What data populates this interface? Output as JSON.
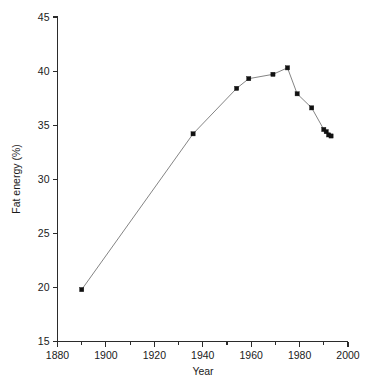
{
  "chart_data": {
    "type": "line",
    "title": "",
    "subtitle": "",
    "xlabel": "Year",
    "ylabel": "Fat energy (%)",
    "xlim": [
      1880,
      2000
    ],
    "ylim": [
      15,
      45
    ],
    "x_ticks": [
      1880,
      1900,
      1920,
      1940,
      1960,
      1980,
      2000
    ],
    "x_tick_labels": [
      "1880",
      "1900",
      "1920",
      "1940",
      "1960",
      "1980",
      "2000"
    ],
    "x_minor_ticks": [
      1890,
      1910,
      1930,
      1950,
      1970,
      1990
    ],
    "y_ticks": [
      15,
      20,
      25,
      30,
      35,
      40,
      45
    ],
    "y_tick_labels": [
      "15",
      "20",
      "25",
      "30",
      "35",
      "40",
      "45"
    ],
    "grid": false,
    "legend": false,
    "legend_position": "none",
    "marker": "square",
    "marker_color": "#111111",
    "line_color": "#6e6e6e",
    "series": [
      {
        "name": "Fat energy",
        "x": [
          1890,
          1936,
          1954,
          1959,
          1969,
          1975,
          1979,
          1985,
          1990,
          1991,
          1992,
          1993
        ],
        "values": [
          19.8,
          34.2,
          38.4,
          39.3,
          39.7,
          40.3,
          37.9,
          36.6,
          34.6,
          34.4,
          34.1,
          34.0
        ]
      }
    ],
    "points": [
      {
        "year": 1890,
        "fat_energy": 19.8
      },
      {
        "year": 1936,
        "fat_energy": 34.2
      },
      {
        "year": 1954,
        "fat_energy": 38.4
      },
      {
        "year": 1959,
        "fat_energy": 39.3
      },
      {
        "year": 1969,
        "fat_energy": 39.7
      },
      {
        "year": 1975,
        "fat_energy": 40.3
      },
      {
        "year": 1979,
        "fat_energy": 37.9
      },
      {
        "year": 1985,
        "fat_energy": 36.6
      },
      {
        "year": 1990,
        "fat_energy": 34.6
      },
      {
        "year": 1991,
        "fat_energy": 34.4
      },
      {
        "year": 1992,
        "fat_energy": 34.1
      },
      {
        "year": 1993,
        "fat_energy": 34.0
      }
    ]
  },
  "colors": {
    "background": "#ffffff",
    "axis": "#2b2b2b",
    "text": "#1a1a1a",
    "line": "#6e6e6e",
    "marker": "#111111"
  }
}
